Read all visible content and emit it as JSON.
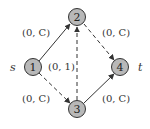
{
  "diagram": {
    "type": "directed-flow-network",
    "nodes": [
      {
        "id": "1",
        "label": "1",
        "x": 33,
        "y": 67,
        "role": "source",
        "side_label": "s"
      },
      {
        "id": "2",
        "label": "2",
        "x": 77,
        "y": 17
      },
      {
        "id": "3",
        "label": "3",
        "x": 77,
        "y": 109
      },
      {
        "id": "4",
        "label": "4",
        "x": 120,
        "y": 67,
        "role": "sink",
        "side_label": "t"
      }
    ],
    "edges": [
      {
        "from": "1",
        "to": "2",
        "label": "(0, C)",
        "style": "solid"
      },
      {
        "from": "1",
        "to": "3",
        "label": "(0, C)",
        "style": "dashed"
      },
      {
        "from": "3",
        "to": "2",
        "label": "(0, 1)",
        "style": "dashed"
      },
      {
        "from": "2",
        "to": "4",
        "label": "(0, C)",
        "style": "dashed"
      },
      {
        "from": "3",
        "to": "4",
        "label": "(0, C)",
        "style": "solid"
      }
    ],
    "colors": {
      "node_fill": "#b8b8b8",
      "node_stroke": "#333333",
      "edge": "#333333"
    }
  }
}
